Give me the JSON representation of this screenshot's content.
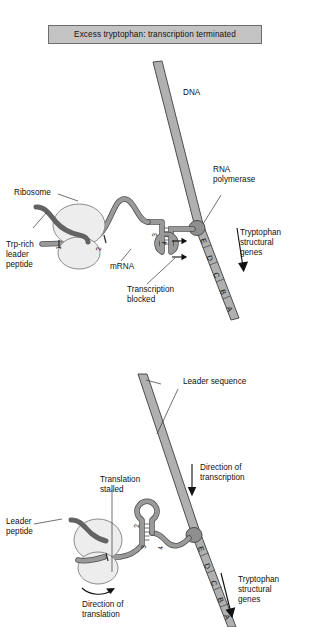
{
  "figure": {
    "colors": {
      "dna_fill": "#b0b0b0",
      "dna_stroke": "#4d4d4d",
      "mrna_fill": "#9a9a9a",
      "mrna_stroke": "#4d4d4d",
      "peptide_fill": "#636363",
      "ribosome_fill": "#ededed",
      "ribosome_stroke": "#8c8c8c",
      "polymerase_fill": "#8f8f8f",
      "title_bar_fill": "#c3c3c3",
      "title_bar_border": "#6d6d6d",
      "text": "#111111",
      "leader_line": "#333333"
    }
  },
  "panels": [
    {
      "id": "excess-tryptophan",
      "title": "Excess tryptophan:  transcription terminated",
      "labels": {
        "dna": "DNA",
        "ribosome": "Ribosome",
        "trp_rich_leader_peptide": "Trp-rich\nleader\npeptide",
        "mrna": "mRNA",
        "rna_polymerase": "RNA\npolymerase",
        "tryptophan_structural_genes": "Tryptophan\nstructural\ngenes",
        "transcription_blocked": "Transcription\nblocked"
      },
      "mrna_regions": [
        "1",
        "2",
        "3",
        "4"
      ],
      "gene_boxes": [
        "E",
        "D",
        "C",
        "B",
        "A"
      ],
      "arrows": {
        "structural_genes_direction": "down",
        "termination_arrows_count": 2
      }
    },
    {
      "id": "tryptophan-starved",
      "title": "Tryptophan-starved:  transcription not terminated",
      "labels": {
        "leader_sequence": "Leader sequence",
        "direction_of_transcription": "Direction of\ntranscription",
        "translation_stalled": "Translation\nstalled",
        "leader_peptide": "Leader\npeptide",
        "direction_of_translation": "Direction of\ntranslation",
        "tryptophan_structural_genes": "Tryptophan\nstructural\ngenes"
      },
      "mrna_regions": [
        "2",
        "3",
        "4"
      ],
      "gene_boxes": [
        "E",
        "D",
        "C",
        "B",
        "A"
      ],
      "arrows": {
        "transcription_direction": "down",
        "translation_direction": "curved-right",
        "structural_genes_direction": "down"
      }
    }
  ]
}
